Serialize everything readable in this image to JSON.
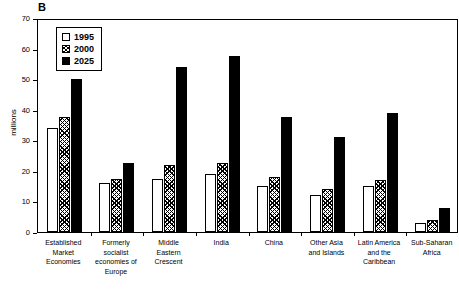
{
  "panel": {
    "label": "B"
  },
  "chart_data": {
    "type": "bar",
    "title": "",
    "subtitle": "",
    "xlabel": "",
    "ylabel": "millions",
    "ylim": [
      0,
      70
    ],
    "yticks": [
      0,
      10,
      20,
      30,
      40,
      50,
      60,
      70
    ],
    "ytick_labels": [
      "0",
      "10",
      "20",
      "30",
      "40",
      "50",
      "60",
      "70"
    ],
    "grid": false,
    "legend_position": "top-left",
    "categories": [
      "Established Market Economies",
      "Formerly socialist economies of Europe",
      "Middle Eastern Crescent",
      "India",
      "China",
      "Other Asia and Islands",
      "Latin America and the Caribbean",
      "Sub-Saharan Africa"
    ],
    "category_lines": [
      [
        "Established",
        "Market",
        "Economies"
      ],
      [
        "Formerly",
        "socialist",
        "economies of",
        "Europe"
      ],
      [
        "Middle",
        "Eastern",
        "Crescent"
      ],
      [
        "India"
      ],
      [
        "China"
      ],
      [
        "Other Asia",
        "and Islands"
      ],
      [
        "Latin America",
        "and the",
        "Caribbean"
      ],
      [
        "Sub-Saharan",
        "Africa"
      ]
    ],
    "series": [
      {
        "name": "1995",
        "fill": "white",
        "values": [
          34,
          16,
          17.5,
          19,
          15,
          12,
          15,
          3
        ]
      },
      {
        "name": "2000",
        "fill": "hatch",
        "values": [
          37.5,
          17.5,
          22,
          22.5,
          18,
          14,
          17,
          4
        ]
      },
      {
        "name": "2025",
        "fill": "black",
        "values": [
          50,
          22.5,
          54,
          57.5,
          37.5,
          31,
          39,
          8
        ]
      }
    ]
  },
  "legend": {
    "entries": [
      {
        "label": "1995"
      },
      {
        "label": "2000"
      },
      {
        "label": "2025"
      }
    ]
  },
  "colors": {
    "axis": "#000000",
    "series_1995": "#ffffff",
    "series_2000": "#808080",
    "series_2025": "#000000",
    "background": "#ffffff"
  }
}
